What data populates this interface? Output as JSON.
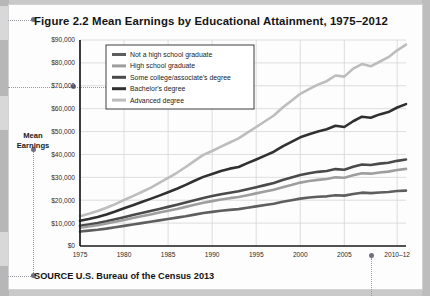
{
  "figure": {
    "title": "Figure 2.2  Mean Earnings by Educational Attainment, 1975–2012",
    "source": "SOURCE  U.S. Bureau of the Census 2013",
    "axis_title_line1": "Mean",
    "axis_title_line2": "Earnings"
  },
  "chart_data": {
    "type": "line",
    "title": "Figure 2.2  Mean Earnings by Educational Attainment, 1975–2012",
    "xlabel": "",
    "ylabel": "Mean Earnings",
    "xlim": [
      1975,
      2012
    ],
    "ylim": [
      0,
      90000
    ],
    "grid": true,
    "legend_position": "upper-left-inside",
    "ytick_labels": [
      "$0",
      "$10,000",
      "$20,000",
      "$30,000",
      "$40,000",
      "$50,000",
      "$60,000",
      "$70,000",
      "$80,000",
      "$90,000"
    ],
    "ytick_values": [
      0,
      10000,
      20000,
      30000,
      40000,
      50000,
      60000,
      70000,
      80000,
      90000
    ],
    "xtick_labels": [
      "1975",
      "1980",
      "1985",
      "1990",
      "1995",
      "2000",
      "2005",
      "2010–12"
    ],
    "xtick_values": [
      1975,
      1980,
      1985,
      1990,
      1995,
      2000,
      2005,
      2011
    ],
    "x": [
      1975,
      1976,
      1977,
      1978,
      1979,
      1980,
      1981,
      1982,
      1983,
      1984,
      1985,
      1986,
      1987,
      1988,
      1989,
      1990,
      1991,
      1992,
      1993,
      1994,
      1995,
      1996,
      1997,
      1998,
      1999,
      2000,
      2001,
      2002,
      2003,
      2004,
      2005,
      2006,
      2007,
      2008,
      2009,
      2010,
      2011,
      2012
    ],
    "series": [
      {
        "name": "Advanced degree",
        "color": "#bdbdbd",
        "width": 2.6,
        "values": [
          13000,
          14100,
          15300,
          16700,
          18300,
          20100,
          21800,
          23600,
          25400,
          27600,
          29800,
          32000,
          34500,
          37200,
          39800,
          41500,
          43400,
          45200,
          47000,
          49500,
          52000,
          54500,
          57000,
          60500,
          63500,
          66500,
          68500,
          70500,
          72000,
          74500,
          74000,
          77500,
          79500,
          78500,
          80500,
          82500,
          85500,
          88000
        ]
      },
      {
        "name": "Bachelor's degree",
        "color": "#303030",
        "width": 2.6,
        "values": [
          11000,
          11800,
          12700,
          13800,
          15100,
          16500,
          17800,
          19200,
          20600,
          22000,
          23500,
          25000,
          26700,
          28500,
          30200,
          31500,
          32800,
          33800,
          34500,
          36200,
          37800,
          39500,
          41200,
          43500,
          45500,
          47500,
          48800,
          50000,
          51000,
          52500,
          52000,
          54500,
          56500,
          56000,
          57500,
          58500,
          60500,
          62000
        ]
      },
      {
        "name": "Some college/associate's degree",
        "color": "#4a4a4a",
        "width": 2.6,
        "values": [
          8800,
          9400,
          10000,
          10800,
          11700,
          12600,
          13500,
          14400,
          15300,
          16200,
          17100,
          18000,
          19000,
          20000,
          21000,
          21800,
          22600,
          23300,
          23900,
          24800,
          25700,
          26600,
          27500,
          28800,
          29900,
          31000,
          31800,
          32400,
          32800,
          33600,
          33300,
          34600,
          35600,
          35400,
          36000,
          36400,
          37200,
          37800
        ]
      },
      {
        "name": "High school graduate",
        "color": "#9e9e9e",
        "width": 2.6,
        "values": [
          8000,
          8500,
          9100,
          9800,
          10600,
          11400,
          12200,
          13000,
          13800,
          14600,
          15400,
          16200,
          17100,
          18000,
          18900,
          19600,
          20300,
          20900,
          21400,
          22200,
          23000,
          23800,
          24600,
          25700,
          26700,
          27700,
          28400,
          28900,
          29300,
          30000,
          29800,
          30900,
          31800,
          31600,
          32100,
          32500,
          33200,
          33700
        ]
      },
      {
        "name": "Not a high school graduate",
        "color": "#5e5e5e",
        "width": 2.6,
        "values": [
          6300,
          6700,
          7100,
          7600,
          8200,
          8800,
          9400,
          10000,
          10600,
          11200,
          11800,
          12400,
          13000,
          13700,
          14400,
          14900,
          15400,
          15800,
          16100,
          16700,
          17300,
          17900,
          18500,
          19300,
          20000,
          20700,
          21200,
          21500,
          21700,
          22200,
          22000,
          22700,
          23300,
          23100,
          23400,
          23600,
          24000,
          24200
        ]
      }
    ],
    "legend_order": [
      "Not a high school graduate",
      "High school graduate",
      "Some college/associate's degree",
      "Bachelor's degree",
      "Advanced degree"
    ]
  }
}
